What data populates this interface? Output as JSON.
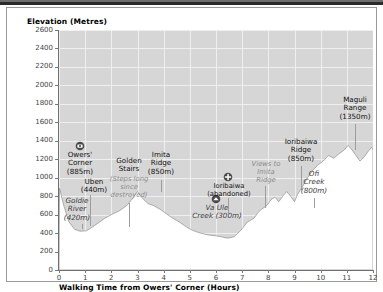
{
  "chart_data": {
    "type": "area",
    "title": "",
    "ylabel": "Elevation (Metres)",
    "xlabel": "Walking Time from Owers' Corner (Hours)",
    "ylim": [
      0,
      2600
    ],
    "xlim": [
      0,
      12
    ],
    "ytick_labels": [
      "0",
      "200",
      "400",
      "600",
      "800",
      "1000",
      "1200",
      "1400",
      "1600",
      "1800",
      "2000",
      "2200",
      "2400",
      "2600"
    ],
    "xtick_labels": [
      "0",
      "1",
      "2",
      "3",
      "4",
      "5",
      "6",
      "7",
      "8",
      "9",
      "10",
      "11",
      "12"
    ],
    "grid": true,
    "legend": "none",
    "series_name": "Kokoda Track elevation profile",
    "points": [
      [
        0.0,
        0
      ],
      [
        0.02,
        885
      ],
      [
        0.18,
        700
      ],
      [
        0.38,
        520
      ],
      [
        0.6,
        440
      ],
      [
        0.8,
        420
      ],
      [
        1.05,
        425
      ],
      [
        1.25,
        460
      ],
      [
        1.5,
        510
      ],
      [
        1.75,
        560
      ],
      [
        2.0,
        600
      ],
      [
        2.3,
        640
      ],
      [
        2.6,
        700
      ],
      [
        2.85,
        790
      ],
      [
        3.0,
        850
      ],
      [
        3.12,
        800
      ],
      [
        3.25,
        760
      ],
      [
        3.4,
        720
      ],
      [
        3.6,
        700
      ],
      [
        3.85,
        660
      ],
      [
        4.1,
        610
      ],
      [
        4.35,
        560
      ],
      [
        4.6,
        520
      ],
      [
        4.85,
        470
      ],
      [
        5.1,
        430
      ],
      [
        5.4,
        400
      ],
      [
        5.7,
        380
      ],
      [
        6.0,
        370
      ],
      [
        6.2,
        360
      ],
      [
        6.45,
        345
      ],
      [
        6.7,
        360
      ],
      [
        6.95,
        430
      ],
      [
        7.2,
        520
      ],
      [
        7.45,
        560
      ],
      [
        7.6,
        620
      ],
      [
        7.75,
        660
      ],
      [
        7.95,
        700
      ],
      [
        8.1,
        760
      ],
      [
        8.25,
        790
      ],
      [
        8.4,
        740
      ],
      [
        8.55,
        800
      ],
      [
        8.7,
        850
      ],
      [
        8.85,
        800
      ],
      [
        9.0,
        740
      ],
      [
        9.12,
        820
      ],
      [
        9.3,
        900
      ],
      [
        9.5,
        1000
      ],
      [
        9.7,
        1080
      ],
      [
        9.9,
        1140
      ],
      [
        10.1,
        1180
      ],
      [
        10.3,
        1240
      ],
      [
        10.5,
        1210
      ],
      [
        10.7,
        1260
      ],
      [
        10.9,
        1300
      ],
      [
        11.05,
        1350
      ],
      [
        11.2,
        1300
      ],
      [
        11.35,
        1240
      ],
      [
        11.5,
        1180
      ],
      [
        11.65,
        1220
      ],
      [
        11.8,
        1280
      ],
      [
        11.95,
        1330
      ],
      [
        12.0,
        1300
      ],
      [
        12.0,
        0
      ]
    ],
    "annotations": [
      {
        "id": "owers-corner",
        "label": "Owers'\nCorner\n(885m)",
        "elevation_m": 885,
        "hours": 0.05,
        "style": "plain",
        "icon": "camera-marker"
      },
      {
        "id": "uben",
        "label": "Uben\n(440m)",
        "elevation_m": 440,
        "hours": 0.65,
        "style": "plain",
        "icon": "none"
      },
      {
        "id": "goldie-river",
        "label": "Goldie\nRiver\n(420m)",
        "elevation_m": 420,
        "hours": 0.85,
        "style": "italic",
        "icon": "none"
      },
      {
        "id": "golden-stairs",
        "label": "Golden\nStairs",
        "sub": "(Steps long\nsince\ndestroyed)",
        "hours": 1.9,
        "style": "plain",
        "icon": "none"
      },
      {
        "id": "imita-ridge",
        "label": "Imita\nRidge\n(850m)",
        "elevation_m": 850,
        "hours": 3.0,
        "style": "plain",
        "icon": "none"
      },
      {
        "id": "va-ule-creek",
        "label": "Va Ule\nCreek (300m)",
        "elevation_m": 300,
        "hours": 6.4,
        "style": "italic",
        "icon": "circle-marker"
      },
      {
        "id": "ioribaiwa",
        "label": "Ioribaiwa\n(abandoned)",
        "hours": 6.9,
        "style": "plain",
        "icon": "cross-marker"
      },
      {
        "id": "views-to-imita-ridge",
        "label": "Views to\nImita\nRidge",
        "hours": 7.6,
        "style": "faint",
        "icon": "none"
      },
      {
        "id": "ioribaiwa-ridge",
        "label": "Ioribaiwa\nRidge\n(850m)",
        "elevation_m": 850,
        "hours": 8.7,
        "style": "plain",
        "icon": "none"
      },
      {
        "id": "ofi-creek",
        "label": "Ofi\nCreek\n(800m)",
        "elevation_m": 800,
        "hours": 9.05,
        "style": "italic",
        "icon": "none"
      },
      {
        "id": "maguli-range",
        "label": "Maguli\nRange\n(1350m)",
        "elevation_m": 1350,
        "hours": 11.05,
        "style": "plain",
        "icon": "none"
      }
    ]
  },
  "axes": {
    "y_title": "Elevation (Metres)",
    "x_title": "Walking Time from Owers' Corner (Hours)",
    "y_ticks": [
      "2600",
      "2400",
      "2200",
      "2000",
      "1800",
      "1600",
      "1400",
      "1200",
      "1000",
      "800",
      "600",
      "400",
      "200",
      "0"
    ],
    "x_ticks": [
      "0",
      "1",
      "2",
      "3",
      "4",
      "5",
      "6",
      "7",
      "8",
      "9",
      "10",
      "11",
      "12"
    ]
  },
  "labels": {
    "owers_corner": "Owers'",
    "owers_corner_l2": "Corner",
    "owers_corner_l3": "(885m)",
    "uben": "Uben",
    "uben_l2": "(440m)",
    "goldie_river": "Goldie",
    "goldie_river_l2": "River",
    "goldie_river_l3": "(420m)",
    "golden_stairs": "Golden",
    "golden_stairs_l2": "Stairs",
    "golden_stairs_sub1": "(Steps long",
    "golden_stairs_sub2": "since",
    "golden_stairs_sub3": "destroyed)",
    "imita_ridge": "Imita",
    "imita_ridge_l2": "Ridge",
    "imita_ridge_l3": "(850m)",
    "va_ule": "Va Ule",
    "va_ule_l2": "Creek (300m)",
    "ioribaiwa": "Ioribaiwa",
    "ioribaiwa_l2": "(abandoned)",
    "views_l1": "Views to",
    "views_l2": "Imita",
    "views_l3": "Ridge",
    "ioribaiwa_ridge": "Ioribaiwa",
    "ioribaiwa_ridge_l2": "Ridge",
    "ioribaiwa_ridge_l3": "(850m)",
    "ofi_creek": "Ofi",
    "ofi_creek_l2": "Creek",
    "ofi_creek_l3": "(800m)",
    "maguli": "Maguli",
    "maguli_l2": "Range",
    "maguli_l3": "(1350m)"
  },
  "colors": {
    "plot_background": "#d6d6d6",
    "profile_fill": "#ffffff",
    "grid": "#efefef",
    "axis": "#6f6f6f",
    "text": "#111111",
    "faint_text": "#8c8c8c",
    "frame": "#9a9a9a",
    "top_band": "#2b2b2b"
  }
}
